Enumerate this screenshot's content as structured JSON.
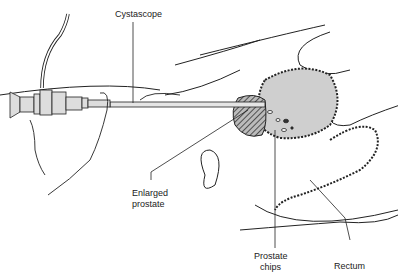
{
  "labels": {
    "cystoscope": "Cystascope",
    "enlarged_prostate_line1": "Enlarged",
    "enlarged_prostate_line2": "prostate",
    "prostate_chips_line1": "Prostate",
    "prostate_chips_line2": "chips",
    "rectum": "Rectum"
  },
  "colors": {
    "line": "#222222",
    "bladder_fill": "#cfcfcf",
    "prostate_fill": "#555555",
    "background": "#ffffff"
  }
}
